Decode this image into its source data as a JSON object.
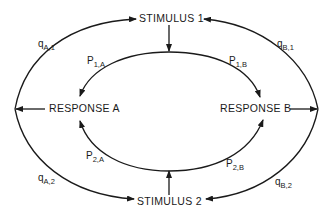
{
  "diagram": {
    "nodes": {
      "stimulus1": "STIMULUS 1",
      "stimulus2": "STIMULUS 2",
      "responseA": "RESPONSE A",
      "responseB": "RESPONSE B"
    },
    "labels": {
      "qA1": {
        "base": "q",
        "sub": "A,1"
      },
      "qB1": {
        "base": "q",
        "sub": "B,1"
      },
      "qA2": {
        "base": "q",
        "sub": "A,2"
      },
      "qB2": {
        "base": "q",
        "sub": "B,2"
      },
      "p1A": {
        "base": "P",
        "sub": "1,A"
      },
      "p1B": {
        "base": "P",
        "sub": "1,B"
      },
      "p2A": {
        "base": "P",
        "sub": "2,A"
      },
      "p2B": {
        "base": "P",
        "sub": "2,B"
      }
    },
    "edges": [
      {
        "from": "STIMULUS 1",
        "to": "RESPONSE A",
        "label": "P1,A"
      },
      {
        "from": "STIMULUS 1",
        "to": "RESPONSE B",
        "label": "P1,B"
      },
      {
        "from": "STIMULUS 2",
        "to": "RESPONSE A",
        "label": "P2,A"
      },
      {
        "from": "STIMULUS 2",
        "to": "RESPONSE B",
        "label": "P2,B"
      },
      {
        "from": "RESPONSE A",
        "to": "STIMULUS 1",
        "label": "qA,1"
      },
      {
        "from": "RESPONSE A",
        "to": "STIMULUS 2",
        "label": "qA,2"
      },
      {
        "from": "RESPONSE B",
        "to": "STIMULUS 1",
        "label": "qB,1"
      },
      {
        "from": "RESPONSE B",
        "to": "STIMULUS 2",
        "label": "qB,2"
      }
    ],
    "colors": {
      "line": "#1a1a1a",
      "background": "#ffffff"
    }
  }
}
